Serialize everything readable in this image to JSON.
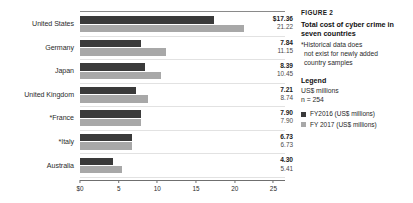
{
  "chart_data": {
    "type": "bar",
    "orientation": "horizontal",
    "title": "Total cost of cyber crime in seven countries",
    "xlabel": "",
    "ylabel": "",
    "xlim": [
      0,
      26.5
    ],
    "grid": true,
    "legend_position": "right",
    "categories": [
      "United States",
      "Germany",
      "Japan",
      "United Kingdom",
      "*France",
      "*Italy",
      "Australia"
    ],
    "series": [
      {
        "name": "FY2016 (US$ millions)",
        "color": "#3a3a3a",
        "values": [
          17.36,
          7.84,
          8.39,
          7.21,
          7.9,
          6.73,
          4.3
        ]
      },
      {
        "name": "FY 2017 (US$ millions)",
        "color": "#a8a8a8",
        "values": [
          21.22,
          11.15,
          10.45,
          8.74,
          7.9,
          6.73,
          5.41
        ]
      }
    ],
    "value_labels": [
      {
        "primary": "$17.36",
        "secondary": "21.22"
      },
      {
        "primary": "7.84",
        "secondary": "11.15"
      },
      {
        "primary": "8.39",
        "secondary": "10.45"
      },
      {
        "primary": "7.21",
        "secondary": "8.74"
      },
      {
        "primary": "7.90",
        "secondary": "7.90"
      },
      {
        "primary": "6.73",
        "secondary": "6.73"
      },
      {
        "primary": "4.30",
        "secondary": "5.41"
      }
    ],
    "xticks": [
      {
        "value": 0,
        "label": "$0"
      },
      {
        "value": 5,
        "label": "5"
      },
      {
        "value": 10,
        "label": "10"
      },
      {
        "value": 15,
        "label": "15"
      },
      {
        "value": 20,
        "label": "20"
      },
      {
        "value": 25,
        "label": "25"
      }
    ]
  },
  "caption": {
    "kicker": "FIGURE 2",
    "title_line1": "Total cost of cyber crime",
    "title_line2": "in seven countries",
    "footnote_line1": "*Historical data does",
    "footnote_line2": "not exist for newly added",
    "footnote_line3": "country samples"
  },
  "legend": {
    "heading": "Legend",
    "units": "US$ millions",
    "sample_size": "n = 254",
    "items": [
      {
        "label": "FY2016 (US$ millions)",
        "color": "#3a3a3a"
      },
      {
        "label": "FY 2017 (US$ millions)",
        "color": "#a8a8a8"
      }
    ]
  }
}
